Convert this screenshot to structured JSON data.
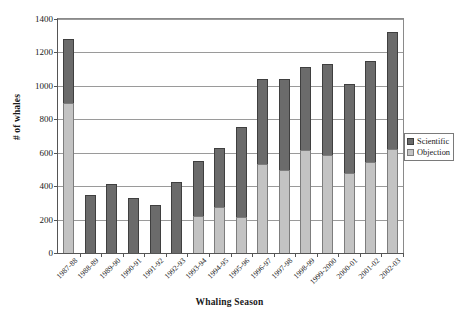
{
  "chart_data": {
    "type": "bar",
    "stacked": true,
    "title": "",
    "xlabel": "Whaling Season",
    "ylabel": "# of whales",
    "ylim": [
      0,
      1400
    ],
    "ytick_step": 200,
    "yticks": [
      0,
      200,
      400,
      600,
      800,
      1000,
      1200,
      1400
    ],
    "ytick_labels": [
      "0",
      "200",
      "400",
      "600",
      "800",
      "1000",
      "1200",
      "1400"
    ],
    "grid": true,
    "legend_position": "right",
    "categories": [
      "1987-88",
      "1988-89",
      "1989-90",
      "1990-91",
      "1991-92",
      "1992-93",
      "1993-94",
      "1994-95",
      "1995-96",
      "1996-97",
      "1997-98",
      "1998-99",
      "1999-2000",
      "2000-01",
      "2001-02",
      "2002-03"
    ],
    "series": [
      {
        "name": "Objection",
        "color": "#c3c3c3",
        "values": [
          900,
          0,
          0,
          0,
          0,
          0,
          220,
          273,
          213,
          530,
          495,
          615,
          588,
          477,
          545,
          625
        ]
      },
      {
        "name": "Scientific",
        "color": "#6b6b6b",
        "values": [
          380,
          345,
          410,
          327,
          285,
          423,
          333,
          355,
          543,
          510,
          545,
          495,
          540,
          535,
          605,
          695
        ]
      }
    ],
    "totals": [
      1280,
      345,
      410,
      327,
      285,
      423,
      553,
      628,
      756,
      1040,
      1040,
      1110,
      1128,
      1012,
      1150,
      1320
    ]
  },
  "legend": {
    "items": [
      {
        "label": "Scientific",
        "color": "#6b6b6b"
      },
      {
        "label": "Objection",
        "color": "#c3c3c3"
      }
    ]
  },
  "axes": {
    "y_title": "# of whales",
    "x_title": "Whaling Season"
  }
}
